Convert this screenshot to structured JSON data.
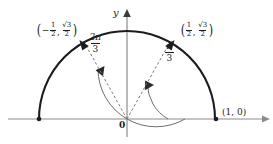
{
  "figure": {
    "background_color": "#ffffff",
    "ink_color": "#1c1c1c",
    "axis_color": "#808080",
    "arc_color": "#5a5a5a",
    "dash_color": "#777777"
  },
  "axes": {
    "y_label": "y",
    "origin_label": "0",
    "x_axis": {
      "y": 119,
      "x_start": 8,
      "x_end": 266,
      "arrow": "right"
    },
    "y_axis": {
      "x": 127,
      "y_start": 136,
      "y_end": 12,
      "arrow": "up"
    }
  },
  "circle": {
    "center_x": 127,
    "center_y": 119,
    "radius": 88,
    "span": "upper semicircle"
  },
  "points": [
    {
      "name": "point-right",
      "label_parts": {
        "open": "(",
        "x": "1",
        "x_num": "1",
        "x_den": "2",
        "sep": ",",
        "y_num": "√3",
        "y_den": "2",
        "close": ")"
      },
      "label_text": "(1/2, √3/2)",
      "angle_deg": 60,
      "marker_x": 171,
      "marker_y": 43,
      "label_x": 179,
      "label_y": 24
    },
    {
      "name": "point-left",
      "label_parts": {
        "open": "(",
        "sign": "−",
        "x_num": "1",
        "x_den": "2",
        "sep": ",",
        "y_num": "√3",
        "y_den": "2",
        "close": ")"
      },
      "label_text": "(−1/2, √3/2)",
      "angle_deg": 120,
      "marker_x": 83,
      "marker_y": 43,
      "label_x": 37,
      "label_y": 24
    },
    {
      "name": "point-one-zero",
      "label_text": "(1, 0)",
      "angle_deg": 0,
      "marker_x": 216,
      "marker_y": 119,
      "label_x": 223,
      "label_y": 112
    },
    {
      "name": "point-neg-one-zero",
      "label_text": "",
      "angle_deg": 180,
      "marker_x": 39,
      "marker_y": 119
    }
  ],
  "angles": [
    {
      "name": "angle-two-pi-thirds",
      "numerator": "2π",
      "denominator": "3",
      "text": "2π/3",
      "degrees": 120,
      "label_x": 89,
      "label_y": 39,
      "arc_radius": 58
    },
    {
      "name": "angle-pi-thirds",
      "numerator": "π",
      "denominator": "3",
      "text": "π/3",
      "degrees": 60,
      "label_x": 166,
      "label_y": 48,
      "arc_radius": 41
    }
  ]
}
